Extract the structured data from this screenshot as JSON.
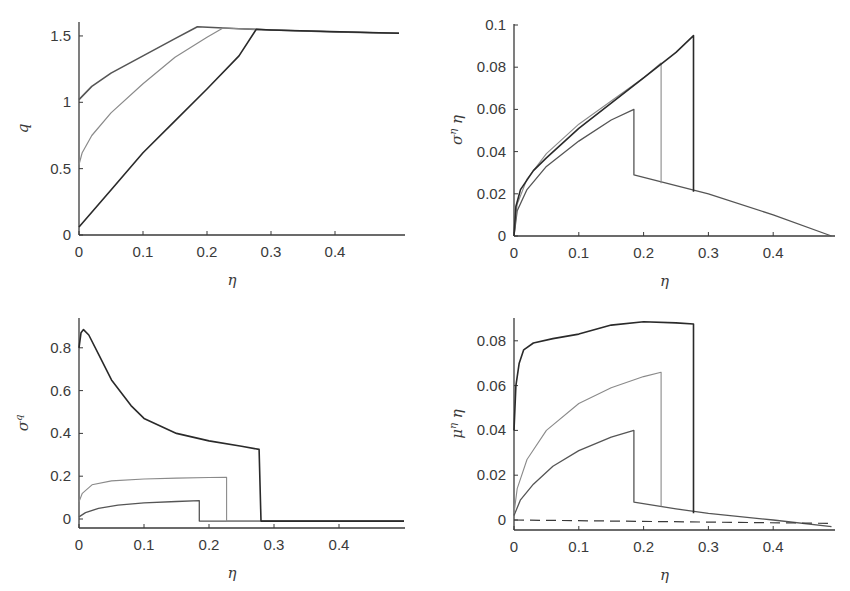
{
  "chart_data": [
    {
      "id": "q",
      "type": "line",
      "title": "",
      "xlabel": "η",
      "ylabel": "q",
      "xlim": [
        0,
        0.5
      ],
      "ylim": [
        0,
        1.6
      ],
      "xticks": [
        0,
        0.1,
        0.2,
        0.3,
        0.4
      ],
      "xtick_labels": [
        "0",
        "0.1",
        "0.2",
        "0.3",
        "0.4"
      ],
      "yticks": [
        0,
        0.5,
        1,
        1.5
      ],
      "ytick_labels": [
        "0",
        "0.5",
        "1",
        "1.5"
      ],
      "grid": false,
      "frame": {
        "x0": 79,
        "y0": 235,
        "x1": 405,
        "y1": 22,
        "px_per_x": 640,
        "px_per_y": 132.7
      },
      "series": [
        {
          "name": "curve-1",
          "color": "#555555",
          "width": 1.6,
          "dash": "",
          "x": [
            0,
            0.02,
            0.05,
            0.1,
            0.15,
            0.185,
            0.25,
            0.3,
            0.4,
            0.5
          ],
          "y": [
            1.02,
            1.12,
            1.22,
            1.35,
            1.48,
            1.57,
            1.555,
            1.545,
            1.53,
            1.52
          ]
        },
        {
          "name": "curve-2",
          "color": "#8a8a8a",
          "width": 1.2,
          "dash": "",
          "x": [
            0,
            0.005,
            0.02,
            0.05,
            0.1,
            0.15,
            0.2,
            0.225,
            0.3,
            0.5
          ],
          "y": [
            0.53,
            0.62,
            0.75,
            0.92,
            1.14,
            1.34,
            1.49,
            1.56,
            1.545,
            1.52
          ]
        },
        {
          "name": "curve-3",
          "color": "#2a2a2a",
          "width": 1.6,
          "dash": "",
          "x": [
            0,
            0.05,
            0.1,
            0.15,
            0.2,
            0.25,
            0.277,
            0.3,
            0.5
          ],
          "y": [
            0.06,
            0.34,
            0.62,
            0.86,
            1.1,
            1.35,
            1.55,
            1.545,
            1.52
          ]
        }
      ]
    },
    {
      "id": "sigma_eta_eta",
      "type": "line",
      "title": "",
      "xlabel": "η",
      "ylabel": "σ^η η",
      "xlim": [
        0,
        0.5
      ],
      "ylim": [
        0,
        0.1
      ],
      "xticks": [
        0,
        0.1,
        0.2,
        0.3,
        0.4
      ],
      "xtick_labels": [
        "0",
        "0.1",
        "0.2",
        "0.3",
        "0.4"
      ],
      "yticks": [
        0,
        0.02,
        0.04,
        0.06,
        0.08,
        0.1
      ],
      "ytick_labels": [
        "0",
        "0.02",
        "0.04",
        "0.06",
        "0.08",
        "0.1"
      ],
      "grid": false,
      "frame": {
        "x0": 514,
        "y0": 236,
        "x1": 835,
        "y1": 24,
        "px_per_x": 648,
        "px_per_y": 2110
      },
      "series": [
        {
          "name": "curve-1",
          "color": "#555555",
          "width": 1.3,
          "dash": "",
          "x": [
            0,
            0.005,
            0.02,
            0.05,
            0.1,
            0.15,
            0.185,
            0.185,
            0.3,
            0.4,
            0.49
          ],
          "y": [
            0,
            0.012,
            0.022,
            0.033,
            0.045,
            0.055,
            0.06,
            0.029,
            0.02,
            0.01,
            0
          ]
        },
        {
          "name": "curve-2",
          "color": "#8a8a8a",
          "width": 1.1,
          "dash": "",
          "x": [
            0,
            0.005,
            0.02,
            0.05,
            0.1,
            0.15,
            0.2,
            0.227,
            0.227
          ],
          "y": [
            0,
            0.015,
            0.027,
            0.039,
            0.053,
            0.064,
            0.075,
            0.082,
            0.025
          ]
        },
        {
          "name": "curve-3",
          "color": "#2a2a2a",
          "width": 1.6,
          "dash": "",
          "x": [
            0,
            0.003,
            0.01,
            0.03,
            0.05,
            0.1,
            0.15,
            0.2,
            0.25,
            0.277,
            0.277
          ],
          "y": [
            0,
            0.014,
            0.022,
            0.031,
            0.037,
            0.051,
            0.063,
            0.075,
            0.087,
            0.095,
            0.021
          ]
        }
      ]
    },
    {
      "id": "sigma_q",
      "type": "line",
      "title": "",
      "xlabel": "η",
      "ylabel": "σ^q",
      "xlim": [
        0,
        0.5
      ],
      "ylim": [
        -0.04,
        0.92
      ],
      "xticks": [
        0,
        0.1,
        0.2,
        0.3,
        0.4
      ],
      "xtick_labels": [
        "0",
        "0.1",
        "0.2",
        "0.3",
        "0.4"
      ],
      "yticks": [
        0,
        0.2,
        0.4,
        0.6,
        0.8
      ],
      "ytick_labels": [
        "0",
        "0.2",
        "0.4",
        "0.6",
        "0.8"
      ],
      "grid": false,
      "frame": {
        "x0": 79,
        "y0": 528,
        "x1": 405,
        "y1": 318,
        "ybase": 519,
        "px_per_x": 650,
        "px_per_y": 214
      },
      "series": [
        {
          "name": "curve-1",
          "color": "#555555",
          "width": 1.3,
          "dash": "",
          "x": [
            0,
            0.01,
            0.03,
            0.06,
            0.1,
            0.15,
            0.185,
            0.185,
            0.5
          ],
          "y": [
            0.01,
            0.03,
            0.05,
            0.065,
            0.075,
            0.082,
            0.086,
            -0.01,
            -0.01
          ]
        },
        {
          "name": "curve-2",
          "color": "#8a8a8a",
          "width": 1.1,
          "dash": "",
          "x": [
            0,
            0.005,
            0.02,
            0.05,
            0.1,
            0.15,
            0.2,
            0.227,
            0.227,
            0.5
          ],
          "y": [
            0.08,
            0.12,
            0.16,
            0.178,
            0.187,
            0.191,
            0.194,
            0.195,
            -0.01,
            -0.01
          ]
        },
        {
          "name": "curve-3",
          "color": "#2a2a2a",
          "width": 1.6,
          "dash": "",
          "x": [
            0,
            0.003,
            0.007,
            0.015,
            0.03,
            0.05,
            0.08,
            0.1,
            0.15,
            0.2,
            0.25,
            0.277,
            0.28,
            0.5
          ],
          "y": [
            0.8,
            0.87,
            0.885,
            0.86,
            0.77,
            0.65,
            0.53,
            0.47,
            0.4,
            0.365,
            0.34,
            0.325,
            -0.01,
            -0.01
          ]
        }
      ]
    },
    {
      "id": "mu_eta_eta",
      "type": "line",
      "title": "",
      "xlabel": "η",
      "ylabel": "μ^η η",
      "xlim": [
        0,
        0.5
      ],
      "ylim": [
        -0.004,
        0.09
      ],
      "xticks": [
        0,
        0.1,
        0.2,
        0.3,
        0.4
      ],
      "xtick_labels": [
        "0",
        "0.1",
        "0.2",
        "0.3",
        "0.4"
      ],
      "yticks": [
        0,
        0.02,
        0.04,
        0.06,
        0.08
      ],
      "ytick_labels": [
        "0",
        "0.02",
        "0.04",
        "0.06",
        "0.08"
      ],
      "grid": false,
      "frame": {
        "x0": 514,
        "y0": 530,
        "x1": 835,
        "y1": 318,
        "ybase": 520,
        "px_per_x": 648,
        "px_per_y": 2240
      },
      "series": [
        {
          "name": "curve-1",
          "color": "#555555",
          "width": 1.3,
          "dash": "",
          "x": [
            0,
            0.01,
            0.03,
            0.06,
            0.1,
            0.15,
            0.185,
            0.185,
            0.25,
            0.3,
            0.4,
            0.49
          ],
          "y": [
            0.002,
            0.009,
            0.016,
            0.024,
            0.031,
            0.037,
            0.04,
            0.008,
            0.005,
            0.003,
            0.0,
            -0.003
          ]
        },
        {
          "name": "curve-2",
          "color": "#8a8a8a",
          "width": 1.1,
          "dash": "",
          "x": [
            0,
            0.005,
            0.02,
            0.05,
            0.1,
            0.15,
            0.2,
            0.227,
            0.227
          ],
          "y": [
            0.003,
            0.014,
            0.027,
            0.04,
            0.052,
            0.059,
            0.064,
            0.066,
            0.006
          ]
        },
        {
          "name": "curve-3",
          "color": "#2a2a2a",
          "width": 1.6,
          "dash": "",
          "x": [
            0,
            0.003,
            0.008,
            0.015,
            0.03,
            0.06,
            0.1,
            0.15,
            0.2,
            0.25,
            0.277,
            0.277
          ],
          "y": [
            0.04,
            0.06,
            0.07,
            0.076,
            0.079,
            0.081,
            0.083,
            0.087,
            0.0885,
            0.088,
            0.0875,
            0.003
          ]
        },
        {
          "name": "zero-reference",
          "color": "#3a3a3a",
          "width": 1.2,
          "dash": "10,6",
          "x": [
            0,
            0.49
          ],
          "y": [
            0,
            -0.0015
          ]
        }
      ]
    }
  ]
}
